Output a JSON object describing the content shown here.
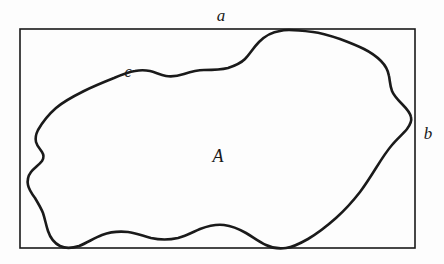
{
  "figure": {
    "background_color": "#fdfdfd",
    "stroke_color": "#1a1a1a",
    "rectangle": {
      "name": "outer-rectangle",
      "x": 20,
      "y": 29,
      "width": 395,
      "height": 219,
      "stroke_width": 1.6
    },
    "blob": {
      "name": "irregular-boundary-curve",
      "stroke_width": 2.6,
      "fill": "none",
      "path": "M 280 31 C 272 32 265 36 259 42 C 253 48 250 54 245 59 C 240 64 234 66 228 68 C 220 70 212 70 204 70 C 196 70 190 72 184 74 C 178 76 172 77 166 76 C 160 75 155 72 150 71 C 145 70 140 70 135 71 C 128 72 121 75 114 78 C 104 82 94 86 84 91 C 74 96 64 101 56 108 C 48 115 42 123 38 130 C 36 134 35 138 36 142 C 37 146 40 149 42 152 C 44 155 44 158 42 161 C 39 165 34 168 31 172 C 28 176 27 180 28 185 C 29 190 32 194 35 198 C 38 203 41 208 43 213 C 45 219 46 225 48 231 C 50 237 54 243 60 246 C 66 249 73 248 79 246 C 87 243 94 238 102 235 C 110 232 119 231 128 232 C 136 233 143 236 151 238 C 160 240 169 240 178 238 C 186 236 193 232 200 229 C 208 226 216 224 224 225 C 232 226 239 229 246 233 C 253 237 259 242 266 245 C 272 248 279 249 286 248 C 294 247 301 243 308 239 C 318 233 327 226 336 218 C 345 210 353 201 360 192 C 366 184 371 176 376 168 C 381 160 386 152 392 145 C 397 139 403 134 407 129 C 410 125 412 121 411 117 C 410 112 406 108 402 104 C 398 100 394 96 392 91 C 390 86 390 81 389 76 C 388 70 385 65 381 61 C 376 56 370 52 364 49 C 356 45 348 42 340 39 C 331 36 322 33 313 32 C 305 31 297 30 289 30 C 286 30 283 30 280 31 Z"
    },
    "labels": [
      {
        "id": "a",
        "text": "a",
        "role": "rectangle-boundary-label",
        "x": 221,
        "y": 15
      },
      {
        "id": "b",
        "text": "b",
        "role": "contact-point-label-right",
        "x": 428,
        "y": 133
      },
      {
        "id": "c",
        "text": "c",
        "role": "curve-label",
        "x": 128,
        "y": 72
      },
      {
        "id": "A",
        "text": "A",
        "role": "region-area-label",
        "x": 218,
        "y": 156
      }
    ]
  }
}
